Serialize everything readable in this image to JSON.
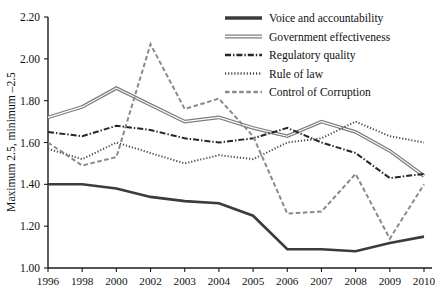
{
  "chart_data": {
    "type": "line",
    "title": "",
    "xlabel": "",
    "ylabel": "Maximum 2.5, minimum –2.5",
    "x": [
      "1996",
      "1998",
      "2000",
      "2002",
      "2003",
      "2004",
      "2005",
      "2006",
      "2007",
      "2008",
      "2009",
      "2010"
    ],
    "categories": [
      "1996",
      "1998",
      "2000",
      "2002",
      "2003",
      "2004",
      "2005",
      "2006",
      "2007",
      "2008",
      "2009",
      "2010"
    ],
    "ylim": [
      1.0,
      2.2
    ],
    "yticks": [
      "1.00",
      "1.20",
      "1.40",
      "1.60",
      "1.80",
      "2.00",
      "2.20"
    ],
    "grid": false,
    "legend_position": "top-right",
    "series": [
      {
        "name": "Voice and accountability",
        "style": "solid",
        "color": "#3b3b3b",
        "values": [
          1.4,
          1.4,
          1.38,
          1.34,
          1.32,
          1.31,
          1.25,
          1.09,
          1.09,
          1.08,
          1.12,
          1.15
        ]
      },
      {
        "name": "Government effectiveness",
        "style": "double-solid",
        "color": "#7d7d7d",
        "values": [
          1.72,
          1.77,
          1.86,
          1.78,
          1.7,
          1.72,
          1.67,
          1.63,
          1.7,
          1.65,
          1.56,
          1.44
        ]
      },
      {
        "name": "Regulatory quality",
        "style": "dash-dot",
        "color": "#262626",
        "values": [
          1.65,
          1.63,
          1.68,
          1.66,
          1.62,
          1.6,
          1.62,
          1.67,
          1.6,
          1.55,
          1.43,
          1.45
        ]
      },
      {
        "name": "Rule of law",
        "style": "dotted",
        "color": "#4a4a4a",
        "values": [
          1.57,
          1.52,
          1.6,
          1.55,
          1.5,
          1.54,
          1.52,
          1.6,
          1.62,
          1.7,
          1.63,
          1.6
        ]
      },
      {
        "name": "Control of Corruption",
        "style": "dashed",
        "color": "#8a8a8a",
        "values": [
          1.6,
          1.49,
          1.53,
          2.07,
          1.76,
          1.81,
          1.63,
          1.26,
          1.27,
          1.45,
          1.14,
          1.4
        ]
      }
    ]
  },
  "legend": {
    "items": [
      {
        "label": "Voice and accountability"
      },
      {
        "label": "Government effectiveness"
      },
      {
        "label": "Regulatory quality"
      },
      {
        "label": "Rule of law"
      },
      {
        "label": "Control of Corruption"
      }
    ]
  }
}
